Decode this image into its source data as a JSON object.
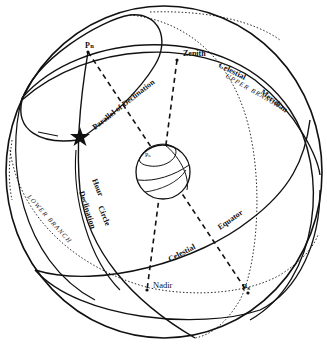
{
  "diagram": {
    "labels": {
      "north_pole": "Pₙ",
      "south_pole": "Pₛ",
      "earth_pole": "Pₙ",
      "zenith": "Zenith",
      "nadir": "Nadir",
      "parallel_of_declination": "Parallel of Declination",
      "celestial_meridian_1": "Celestial",
      "celestial_meridian_2": "Meridian",
      "upper_branch": "UPPER BRANCH",
      "lower_branch": "LOWER BRANCH",
      "hour_circle_1": "Hour",
      "hour_circle_2": "Circle",
      "declination": "Declination",
      "celestial_equator_1": "Celestial",
      "celestial_equator_2": "Equator"
    },
    "colors": {
      "line": "#111111",
      "background": "#ffffff"
    }
  }
}
